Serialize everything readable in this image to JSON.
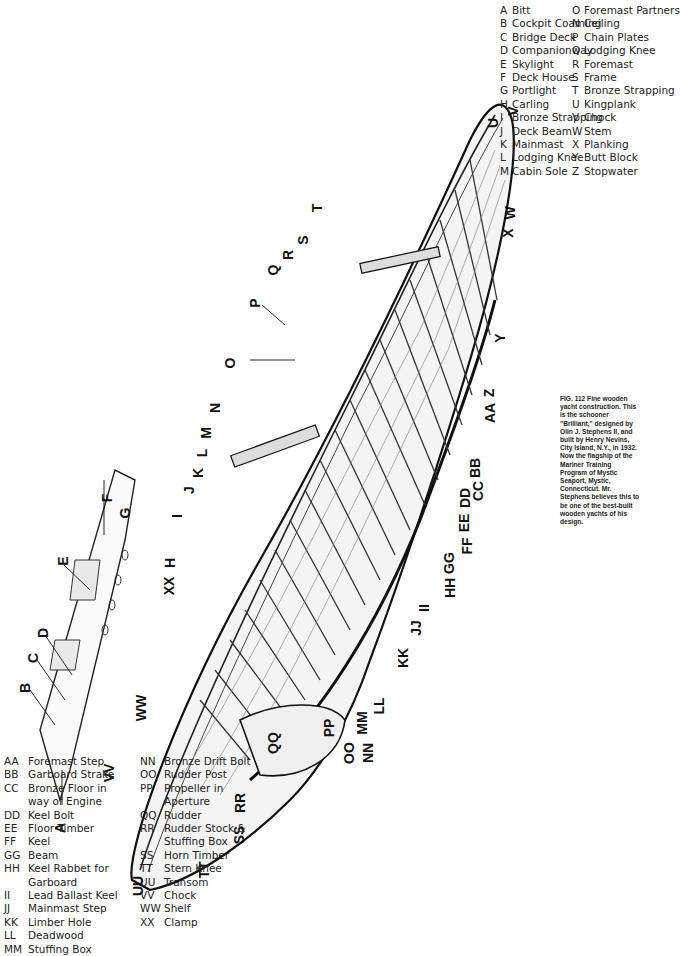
{
  "figure": {
    "number": "FIG. 112",
    "caption": "FIG. 112 Fine wooden yacht construction. This is the schooner \"Brilliant,\" designed by Olin J. Stephens II, and built by Henry Nevins, City Island, N.Y., in 1932. Now the flagship of the Mariner Training Program of Mystic Seaport, Mystic, Connecticut. Mr. Stephens believes this to be one of the best-built wooden yachts of his design."
  },
  "legend_a": [
    {
      "code": "A",
      "label": "Bitt"
    },
    {
      "code": "B",
      "label": "Cockpit Coaming"
    },
    {
      "code": "C",
      "label": "Bridge Deck"
    },
    {
      "code": "D",
      "label": "Companionway"
    },
    {
      "code": "E",
      "label": "Skylight"
    },
    {
      "code": "F",
      "label": "Deck House"
    },
    {
      "code": "G",
      "label": "Portlight"
    },
    {
      "code": "H",
      "label": "Carling"
    },
    {
      "code": "I",
      "label": "Bronze Strapping"
    },
    {
      "code": "J",
      "label": "Deck Beam"
    },
    {
      "code": "K",
      "label": "Mainmast"
    },
    {
      "code": "L",
      "label": "Lodging Knee"
    },
    {
      "code": "M",
      "label": "Cabin Sole"
    }
  ],
  "legend_b": [
    {
      "code": "O",
      "label": "Foremast Partners"
    },
    {
      "code": "N",
      "label": "Ceiling"
    },
    {
      "code": "P",
      "label": "Chain Plates"
    },
    {
      "code": "Q",
      "label": "Lodging Knee"
    },
    {
      "code": "R",
      "label": "Foremast"
    },
    {
      "code": "S",
      "label": "Frame"
    },
    {
      "code": "T",
      "label": "Bronze Strapping"
    },
    {
      "code": "U",
      "label": "Kingplank"
    },
    {
      "code": "V",
      "label": "Chock"
    },
    {
      "code": "W",
      "label": "Stem"
    },
    {
      "code": "X",
      "label": "Planking"
    },
    {
      "code": "Y",
      "label": "Butt Block"
    },
    {
      "code": "Z",
      "label": "Stopwater"
    }
  ],
  "legend_c": [
    {
      "code": "AA",
      "label": "Foremast Step"
    },
    {
      "code": "BB",
      "label": "Garboard Strake"
    },
    {
      "code": "CC",
      "label": "Bronze Floor in"
    },
    {
      "code": "",
      "label": "way of Engine"
    },
    {
      "code": "DD",
      "label": "Keel Bolt"
    },
    {
      "code": "EE",
      "label": "Floor Timber"
    },
    {
      "code": "FF",
      "label": "Keel"
    },
    {
      "code": "GG",
      "label": "Beam"
    },
    {
      "code": "HH",
      "label": "Keel Rabbet for"
    },
    {
      "code": "",
      "label": "Garboard"
    },
    {
      "code": "II",
      "label": "Lead Ballast Keel"
    },
    {
      "code": "JJ",
      "label": "Mainmast Step"
    },
    {
      "code": "KK",
      "label": "Limber Hole"
    },
    {
      "code": "LL",
      "label": "Deadwood"
    },
    {
      "code": "MM",
      "label": "Stuffing Box"
    }
  ],
  "legend_d": [
    {
      "code": "NN",
      "label": "Bronze Drift Bolt"
    },
    {
      "code": "OO",
      "label": "Rudder Post"
    },
    {
      "code": "PP",
      "label": "Propeller in"
    },
    {
      "code": "",
      "label": "Aperture"
    },
    {
      "code": "QQ",
      "label": "Rudder"
    },
    {
      "code": "RR",
      "label": "Rudder Stock &"
    },
    {
      "code": "",
      "label": "Stuffing Box"
    },
    {
      "code": "SS",
      "label": "Horn Timber"
    },
    {
      "code": "TT",
      "label": "Stern Knee"
    },
    {
      "code": "UU",
      "label": "Transom"
    },
    {
      "code": "VV",
      "label": "Chock"
    },
    {
      "code": "WW",
      "label": "Shelf"
    },
    {
      "code": "XX",
      "label": "Clamp"
    }
  ],
  "callouts": [
    {
      "text": "A",
      "x": 55,
      "y": 820
    },
    {
      "text": "B",
      "x": 20,
      "y": 680
    },
    {
      "text": "C",
      "x": 28,
      "y": 650
    },
    {
      "text": "D",
      "x": 38,
      "y": 625
    },
    {
      "text": "E",
      "x": 58,
      "y": 553
    },
    {
      "text": "F",
      "x": 103,
      "y": 490
    },
    {
      "text": "G",
      "x": 120,
      "y": 505
    },
    {
      "text": "H",
      "x": 165,
      "y": 555
    },
    {
      "text": "XX",
      "x": 160,
      "y": 578
    },
    {
      "text": "I",
      "x": 175,
      "y": 508
    },
    {
      "text": "J",
      "x": 185,
      "y": 482
    },
    {
      "text": "K",
      "x": 193,
      "y": 465
    },
    {
      "text": "L",
      "x": 198,
      "y": 445
    },
    {
      "text": "M",
      "x": 200,
      "y": 425
    },
    {
      "text": "N",
      "x": 210,
      "y": 400
    },
    {
      "text": "O",
      "x": 225,
      "y": 355
    },
    {
      "text": "P",
      "x": 250,
      "y": 295
    },
    {
      "text": "Q",
      "x": 268,
      "y": 262
    },
    {
      "text": "R",
      "x": 283,
      "y": 247
    },
    {
      "text": "S",
      "x": 298,
      "y": 232
    },
    {
      "text": "T",
      "x": 313,
      "y": 200
    },
    {
      "text": "U",
      "x": 488,
      "y": 115
    },
    {
      "text": "V",
      "x": 508,
      "y": 103
    },
    {
      "text": "W",
      "x": 503,
      "y": 205
    },
    {
      "text": "X",
      "x": 503,
      "y": 225
    },
    {
      "text": "Y",
      "x": 495,
      "y": 330
    },
    {
      "text": "Z",
      "x": 485,
      "y": 385
    },
    {
      "text": "AA",
      "x": 480,
      "y": 405
    },
    {
      "text": "BB",
      "x": 465,
      "y": 460
    },
    {
      "text": "CC",
      "x": 468,
      "y": 483
    },
    {
      "text": "DD",
      "x": 455,
      "y": 490
    },
    {
      "text": "EE",
      "x": 455,
      "y": 515
    },
    {
      "text": "FF",
      "x": 458,
      "y": 538
    },
    {
      "text": "GG",
      "x": 438,
      "y": 555
    },
    {
      "text": "HH",
      "x": 440,
      "y": 580
    },
    {
      "text": "II",
      "x": 420,
      "y": 600
    },
    {
      "text": "JJ",
      "x": 408,
      "y": 620
    },
    {
      "text": "KK",
      "x": 393,
      "y": 650
    },
    {
      "text": "LL",
      "x": 370,
      "y": 698
    },
    {
      "text": "MM",
      "x": 350,
      "y": 715
    },
    {
      "text": "NN",
      "x": 358,
      "y": 745
    },
    {
      "text": "OO",
      "x": 338,
      "y": 745
    },
    {
      "text": "PP",
      "x": 320,
      "y": 720
    },
    {
      "text": "QQ",
      "x": 262,
      "y": 735
    },
    {
      "text": "RR",
      "x": 230,
      "y": 795
    },
    {
      "text": "SS",
      "x": 230,
      "y": 827
    },
    {
      "text": "TT",
      "x": 195,
      "y": 862
    },
    {
      "text": "UU",
      "x": 128,
      "y": 878
    },
    {
      "text": "VV",
      "x": 100,
      "y": 765
    },
    {
      "text": "WW",
      "x": 128,
      "y": 700
    }
  ]
}
